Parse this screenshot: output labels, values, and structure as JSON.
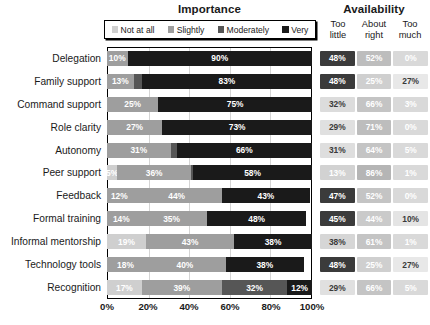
{
  "header": {
    "importance_title": "Importance",
    "availability_title": "Availability"
  },
  "legend": {
    "items": [
      {
        "label": "Not at all",
        "color": "#cfcfcf"
      },
      {
        "label": "Slightly",
        "color": "#9e9e9e"
      },
      {
        "label": "Moderately",
        "color": "#565656"
      },
      {
        "label": "Very",
        "color": "#1a1a1a"
      }
    ]
  },
  "availability_headers": [
    {
      "line1": "Too",
      "line2": "little"
    },
    {
      "line1": "About",
      "line2": "right"
    },
    {
      "line1": "Too",
      "line2": "much"
    }
  ],
  "axis": {
    "ticks": [
      "0%",
      "20%",
      "40%",
      "60%",
      "80%",
      "100%"
    ],
    "min": 0,
    "max": 100
  },
  "chart_data": {
    "type": "bar",
    "title": "Importance",
    "xlabel": "",
    "ylabel": "",
    "xlim": [
      0,
      100
    ],
    "grid": true,
    "orientation": "horizontal",
    "stacked": true,
    "legend_position": "top",
    "categories": [
      "Delegation",
      "Family support",
      "Command support",
      "Role clarity",
      "Autonomy",
      "Peer support",
      "Feedback",
      "Formal training",
      "Informal mentorship",
      "Technology tools",
      "Recognition"
    ],
    "series": [
      {
        "name": "Not at all",
        "color": "#cfcfcf",
        "values": [
          0,
          0,
          0,
          0,
          0,
          5,
          0,
          0,
          0,
          0,
          17
        ]
      },
      {
        "name": "Slightly",
        "color": "#9e9e9e",
        "values": [
          10,
          13,
          25,
          27,
          31,
          36,
          12,
          14,
          19,
          18,
          39
        ]
      },
      {
        "name": "Moderately",
        "color": "#565656",
        "values": [
          0,
          4,
          0,
          0,
          3,
          1,
          44,
          35,
          43,
          40,
          32
        ]
      },
      {
        "name": "Very",
        "color": "#1a1a1a",
        "values": [
          90,
          83,
          75,
          73,
          66,
          58,
          43,
          48,
          38,
          38,
          12
        ]
      }
    ],
    "bar_labels": [
      [
        {
          "value": "10%",
          "pct": 10,
          "color": "#9e9e9e",
          "text": "#ffffff"
        },
        {
          "value": "90%",
          "pct": 90,
          "color": "#1a1a1a",
          "text": "#ffffff"
        }
      ],
      [
        {
          "value": "13%",
          "pct": 13,
          "color": "#9e9e9e",
          "text": "#ffffff"
        },
        {
          "value": "",
          "pct": 4,
          "color": "#565656",
          "text": "#ffffff"
        },
        {
          "value": "83%",
          "pct": 83,
          "color": "#1a1a1a",
          "text": "#ffffff"
        }
      ],
      [
        {
          "value": "25%",
          "pct": 25,
          "color": "#9e9e9e",
          "text": "#ffffff"
        },
        {
          "value": "75%",
          "pct": 75,
          "color": "#1a1a1a",
          "text": "#ffffff"
        }
      ],
      [
        {
          "value": "27%",
          "pct": 27,
          "color": "#9e9e9e",
          "text": "#ffffff"
        },
        {
          "value": "73%",
          "pct": 73,
          "color": "#1a1a1a",
          "text": "#ffffff"
        }
      ],
      [
        {
          "value": "31%",
          "pct": 31,
          "color": "#9e9e9e",
          "text": "#ffffff"
        },
        {
          "value": "",
          "pct": 3,
          "color": "#565656",
          "text": "#ffffff"
        },
        {
          "value": "66%",
          "pct": 66,
          "color": "#1a1a1a",
          "text": "#ffffff"
        }
      ],
      [
        {
          "value": "5%",
          "pct": 5,
          "color": "#cfcfcf",
          "text": "#ffffff"
        },
        {
          "value": "36%",
          "pct": 36,
          "color": "#9e9e9e",
          "text": "#ffffff"
        },
        {
          "value": "",
          "pct": 1,
          "color": "#565656",
          "text": "#ffffff"
        },
        {
          "value": "58%",
          "pct": 58,
          "color": "#1a1a1a",
          "text": "#ffffff"
        }
      ],
      [
        {
          "value": "12%",
          "pct": 12,
          "color": "#9e9e9e",
          "text": "#ffffff"
        },
        {
          "value": "44%",
          "pct": 44,
          "color": "#9e9e9e",
          "text": "#ffffff"
        },
        {
          "value": "43%",
          "pct": 43,
          "color": "#1a1a1a",
          "text": "#ffffff"
        }
      ],
      [
        {
          "value": "14%",
          "pct": 14,
          "color": "#9e9e9e",
          "text": "#ffffff"
        },
        {
          "value": "35%",
          "pct": 35,
          "color": "#9e9e9e",
          "text": "#ffffff"
        },
        {
          "value": "48%",
          "pct": 48,
          "color": "#1a1a1a",
          "text": "#ffffff"
        }
      ],
      [
        {
          "value": "19%",
          "pct": 19,
          "color": "#cfcfcf",
          "text": "#ffffff"
        },
        {
          "value": "43%",
          "pct": 43,
          "color": "#9e9e9e",
          "text": "#ffffff"
        },
        {
          "value": "38%",
          "pct": 38,
          "color": "#1a1a1a",
          "text": "#ffffff"
        }
      ],
      [
        {
          "value": "18%",
          "pct": 18,
          "color": "#9e9e9e",
          "text": "#ffffff"
        },
        {
          "value": "40%",
          "pct": 40,
          "color": "#9e9e9e",
          "text": "#ffffff"
        },
        {
          "value": "38%",
          "pct": 38,
          "color": "#1a1a1a",
          "text": "#ffffff"
        }
      ],
      [
        {
          "value": "17%",
          "pct": 17,
          "color": "#cfcfcf",
          "text": "#ffffff"
        },
        {
          "value": "39%",
          "pct": 39,
          "color": "#9e9e9e",
          "text": "#ffffff"
        },
        {
          "value": "32%",
          "pct": 32,
          "color": "#565656",
          "text": "#ffffff"
        },
        {
          "value": "12%",
          "pct": 12,
          "color": "#1a1a1a",
          "text": "#ffffff"
        }
      ]
    ]
  },
  "availability_data": {
    "type": "heatmap",
    "columns": [
      "Too little",
      "About right",
      "Too much"
    ],
    "rows": [
      {
        "category": "Delegation",
        "cells": [
          {
            "value": "48%",
            "bg": "#3b3b3b",
            "fg": "#ffffff"
          },
          {
            "value": "52%",
            "bg": "#bdbdbd",
            "fg": "#ffffff"
          },
          {
            "value": "0%",
            "bg": "#d9d9d9",
            "fg": "#ffffff"
          }
        ]
      },
      {
        "category": "Family support",
        "cells": [
          {
            "value": "48%",
            "bg": "#3b3b3b",
            "fg": "#ffffff"
          },
          {
            "value": "25%",
            "bg": "#cfcfcf",
            "fg": "#ffffff"
          },
          {
            "value": "27%",
            "bg": "#e8e8e8",
            "fg": "#3a3a3a"
          }
        ]
      },
      {
        "category": "Command support",
        "cells": [
          {
            "value": "32%",
            "bg": "#dcdcdc",
            "fg": "#3a3a3a"
          },
          {
            "value": "66%",
            "bg": "#c4c4c4",
            "fg": "#ffffff"
          },
          {
            "value": "3%",
            "bg": "#d9d9d9",
            "fg": "#ffffff"
          }
        ]
      },
      {
        "category": "Role clarity",
        "cells": [
          {
            "value": "29%",
            "bg": "#e0e0e0",
            "fg": "#3a3a3a"
          },
          {
            "value": "71%",
            "bg": "#bdbdbd",
            "fg": "#ffffff"
          },
          {
            "value": "0%",
            "bg": "#d9d9d9",
            "fg": "#ffffff"
          }
        ]
      },
      {
        "category": "Autonomy",
        "cells": [
          {
            "value": "31%",
            "bg": "#dedede",
            "fg": "#3a3a3a"
          },
          {
            "value": "64%",
            "bg": "#c4c4c4",
            "fg": "#ffffff"
          },
          {
            "value": "5%",
            "bg": "#d9d9d9",
            "fg": "#ffffff"
          }
        ]
      },
      {
        "category": "Peer support",
        "cells": [
          {
            "value": "13%",
            "bg": "#d2d2d2",
            "fg": "#ffffff"
          },
          {
            "value": "86%",
            "bg": "#b5b5b5",
            "fg": "#ffffff"
          },
          {
            "value": "1%",
            "bg": "#d9d9d9",
            "fg": "#ffffff"
          }
        ]
      },
      {
        "category": "Feedback",
        "cells": [
          {
            "value": "47%",
            "bg": "#3b3b3b",
            "fg": "#ffffff"
          },
          {
            "value": "52%",
            "bg": "#c4c4c4",
            "fg": "#ffffff"
          },
          {
            "value": "0%",
            "bg": "#d9d9d9",
            "fg": "#ffffff"
          }
        ]
      },
      {
        "category": "Formal training",
        "cells": [
          {
            "value": "45%",
            "bg": "#3b3b3b",
            "fg": "#ffffff"
          },
          {
            "value": "44%",
            "bg": "#cacaca",
            "fg": "#ffffff"
          },
          {
            "value": "10%",
            "bg": "#e4e4e4",
            "fg": "#3a3a3a"
          }
        ]
      },
      {
        "category": "Informal mentorship",
        "cells": [
          {
            "value": "38%",
            "bg": "#d6d6d6",
            "fg": "#3a3a3a"
          },
          {
            "value": "61%",
            "bg": "#c4c4c4",
            "fg": "#ffffff"
          },
          {
            "value": "1%",
            "bg": "#d9d9d9",
            "fg": "#ffffff"
          }
        ]
      },
      {
        "category": "Technology tools",
        "cells": [
          {
            "value": "48%",
            "bg": "#3b3b3b",
            "fg": "#ffffff"
          },
          {
            "value": "25%",
            "bg": "#cfcfcf",
            "fg": "#ffffff"
          },
          {
            "value": "27%",
            "bg": "#e8e8e8",
            "fg": "#3a3a3a"
          }
        ]
      },
      {
        "category": "Recognition",
        "cells": [
          {
            "value": "29%",
            "bg": "#e0e0e0",
            "fg": "#3a3a3a"
          },
          {
            "value": "66%",
            "bg": "#c4c4c4",
            "fg": "#ffffff"
          },
          {
            "value": "5%",
            "bg": "#d9d9d9",
            "fg": "#ffffff"
          }
        ]
      }
    ]
  }
}
